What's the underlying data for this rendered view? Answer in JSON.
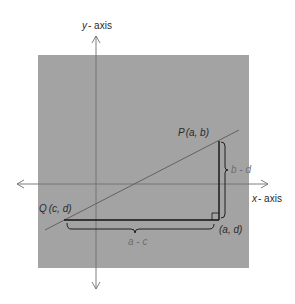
{
  "diagram": {
    "type": "coordinate-geometry",
    "colors": {
      "background": "#ffffff",
      "panel": "#a3a3a3",
      "axis": "#6f6f6f",
      "line": "#5a5a5a",
      "triangle": "#111111",
      "label": "#2a2a2a",
      "muted_label": "#6e6e6e"
    },
    "axes": {
      "y_label_var": "y",
      "y_label_rest": "- axis",
      "x_label_var": "x",
      "x_label_rest": "- axis"
    },
    "points": {
      "P": {
        "name": "P",
        "coords": "(a, b)"
      },
      "Q": {
        "name": "Q",
        "coords": "(c, d)"
      },
      "corner": {
        "coords": "(a, d)"
      }
    },
    "braces": {
      "vertical": "b - d",
      "horizontal": "a - c"
    },
    "annotations": {
      "right_angle_marker": true
    }
  }
}
